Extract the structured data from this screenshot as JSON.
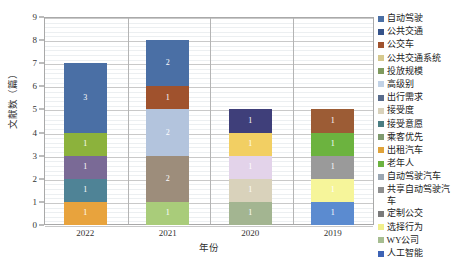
{
  "chart_data": {
    "type": "bar",
    "subtype": "stacked-vertical",
    "title": "",
    "xlabel": "年份",
    "ylabel": "文献数（篇）",
    "ylim": [
      0,
      9
    ],
    "ytick_labels": [
      "0",
      "1",
      "2",
      "3",
      "4",
      "5",
      "6",
      "7",
      "8",
      "9"
    ],
    "ytick_values": [
      0,
      1,
      2,
      3,
      4,
      5,
      6,
      7,
      8,
      9
    ],
    "grid": "horizontal-major-and-minor",
    "legend_position": "right",
    "categories": [
      "2022",
      "2021",
      "2020",
      "2019"
    ],
    "totals": [
      7,
      8,
      5,
      5
    ],
    "series": [
      {
        "name": "自动驾驶",
        "color": "#4a6fa5",
        "values": [
          3,
          2,
          0,
          0
        ]
      },
      {
        "name": "公共交通",
        "color": "#3c5a8f",
        "values": [
          0,
          0,
          0,
          0
        ]
      },
      {
        "name": "公交车",
        "color": "#a0522d",
        "values": [
          0,
          1,
          0,
          1
        ]
      },
      {
        "name": "公共交通系统",
        "color": "#aac1dd",
        "values": [
          0,
          2,
          0,
          0
        ]
      },
      {
        "name": "投放规模",
        "color": "#8f8272",
        "values": [
          0,
          0,
          0,
          0
        ]
      },
      {
        "name": "高级别",
        "color": "#a8987f",
        "values": [
          0,
          2,
          0,
          0
        ]
      },
      {
        "name": "出行需求",
        "color": "#a6c76c",
        "values": [
          0,
          1,
          0,
          0
        ]
      },
      {
        "name": "接受度",
        "color": "#8e9f79",
        "values": [
          0,
          0,
          1,
          0
        ]
      },
      {
        "name": "接受意愿",
        "color": "#3f3f7a",
        "values": [
          0,
          0,
          1,
          0
        ]
      },
      {
        "name": "乘客优先",
        "color": "#d9cfbb",
        "values": [
          0,
          0,
          1,
          0
        ]
      },
      {
        "name": "出租汽车",
        "color": "#e5a93a",
        "values": [
          1,
          0,
          0,
          0
        ]
      },
      {
        "name": "老年人",
        "color": "#62a83f",
        "values": [
          0,
          0,
          0,
          1
        ]
      },
      {
        "name": "自动驾驶汽车",
        "color": "#9aa3ab",
        "values": [
          0,
          0,
          0,
          1
        ]
      },
      {
        "name": "共享自动驾驶汽车",
        "color": "#8a8a8a",
        "values": [
          0,
          0,
          0,
          0
        ]
      },
      {
        "name": "定制公交",
        "color": "#7f7f7f",
        "values": [
          0,
          0,
          0,
          0
        ]
      },
      {
        "name": "选择行为",
        "color": "#f3f07a",
        "values": [
          0,
          0,
          0,
          1
        ]
      },
      {
        "name": "WY公司",
        "color": "#9fb98a",
        "values": [
          0,
          0,
          0,
          0
        ]
      },
      {
        "name": "人工智能",
        "color": "#4472c4",
        "values": [
          0,
          0,
          0,
          1
        ]
      }
    ],
    "bars": [
      {
        "category": "2022",
        "total": 7,
        "segments": [
          {
            "label": "1",
            "value": 1,
            "color": "#e8a33d",
            "series": "出租汽车"
          },
          {
            "label": "1",
            "value": 1,
            "color": "#4f8396",
            "series": "接受度"
          },
          {
            "label": "1",
            "value": 1,
            "color": "#7a6a96",
            "series": "接受意愿"
          },
          {
            "label": "1",
            "value": 1,
            "color": "#8cb23c",
            "series": "出行需求"
          },
          {
            "label": "3",
            "value": 3,
            "color": "#4a6fa5",
            "series": "自动驾驶"
          }
        ]
      },
      {
        "category": "2021",
        "total": 8,
        "segments": [
          {
            "label": "1",
            "value": 1,
            "color": "#a9cc7a",
            "series": "出行需求"
          },
          {
            "label": "2",
            "value": 2,
            "color": "#9d8d7b",
            "series": "高级别"
          },
          {
            "label": "2",
            "value": 2,
            "color": "#b3c4dd",
            "series": "公共交通系统"
          },
          {
            "label": "1",
            "value": 1,
            "color": "#a0522d",
            "series": "公交车"
          },
          {
            "label": "2",
            "value": 2,
            "color": "#4a6fa5",
            "series": "自动驾驶"
          }
        ]
      },
      {
        "category": "2020",
        "total": 5,
        "segments": [
          {
            "label": "1",
            "value": 1,
            "color": "#a3b591",
            "series": "接受度"
          },
          {
            "label": "1",
            "value": 1,
            "color": "#d9d2bb",
            "series": "乘客优先"
          },
          {
            "label": "1",
            "value": 1,
            "color": "#e3d3ea",
            "series": "选择行为"
          },
          {
            "label": "1",
            "value": 1,
            "color": "#f2cf63",
            "series": "出租汽车"
          },
          {
            "label": "1",
            "value": 1,
            "color": "#3f3f7a",
            "series": "接受意愿"
          }
        ]
      },
      {
        "category": "2019",
        "total": 5,
        "segments": [
          {
            "label": "1",
            "value": 1,
            "color": "#5b8bd0",
            "series": "人工智能"
          },
          {
            "label": "1",
            "value": 1,
            "color": "#f6f59a",
            "series": "选择行为"
          },
          {
            "label": "1",
            "value": 1,
            "color": "#9a9a9a",
            "series": "自动驾驶汽车"
          },
          {
            "label": "1",
            "value": 1,
            "color": "#6cb33f",
            "series": "老年人"
          },
          {
            "label": "1",
            "value": 1,
            "color": "#9c5c35",
            "series": "公交车"
          }
        ]
      }
    ],
    "legend": [
      {
        "label": "自动驾驶",
        "color": "#4a6fa5"
      },
      {
        "label": "公共交通",
        "color": "#36538a"
      },
      {
        "label": "公交车",
        "color": "#a0522d"
      },
      {
        "label": "公共交通系统",
        "color": "#d6c98f"
      },
      {
        "label": "投放规模",
        "color": "#7f9a5e"
      },
      {
        "label": "高级别",
        "color": "#c2d2e6"
      },
      {
        "label": "出行需求",
        "color": "#586b8c"
      },
      {
        "label": "接受度",
        "color": "#d9d2bb"
      },
      {
        "label": "接受意愿",
        "color": "#4a7d82"
      },
      {
        "label": "乘客优先",
        "color": "#7f9a6e"
      },
      {
        "label": "出租汽车",
        "color": "#e0a33a"
      },
      {
        "label": "老年人",
        "color": "#6cb33f"
      },
      {
        "label": "自动驾驶汽车",
        "color": "#9aa6b3"
      },
      {
        "label": "共享自动驾驶汽车",
        "color": "#8f8f8f"
      },
      {
        "label": "定制公交",
        "color": "#7a7a7a"
      },
      {
        "label": "选择行为",
        "color": "#f1ef8c"
      },
      {
        "label": "WY公司",
        "color": "#a6bd91"
      },
      {
        "label": "人工智能",
        "color": "#3d63b5"
      }
    ]
  }
}
